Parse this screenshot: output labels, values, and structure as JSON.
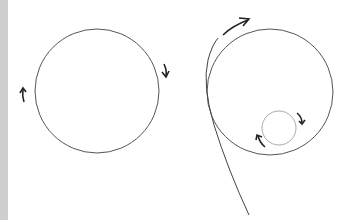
{
  "colors": {
    "stroke": "#444444",
    "arrow": "#222222",
    "small_circle": "#999999",
    "left_bar": "#cfcfcf",
    "background": "#ffffff"
  },
  "diagram": {
    "left_figure": {
      "circle": {
        "cx": 97,
        "cy": 91,
        "r": 62
      },
      "arrows": [
        {
          "name": "clockwise-arrow-right",
          "direction": "down"
        },
        {
          "name": "clockwise-arrow-left",
          "direction": "up"
        }
      ]
    },
    "right_figure": {
      "large_circle": {
        "cx": 270,
        "cy": 92,
        "r": 63
      },
      "small_circle": {
        "cx": 279,
        "cy": 128,
        "r": 17
      },
      "trajectory_curve": "tangent path from bottom sweeping up past the large circle",
      "arrows": [
        {
          "name": "trajectory-arrow",
          "direction": "up-right"
        },
        {
          "name": "small-circle-arrow-right",
          "direction": "down"
        },
        {
          "name": "small-circle-arrow-left",
          "direction": "up"
        }
      ]
    }
  }
}
